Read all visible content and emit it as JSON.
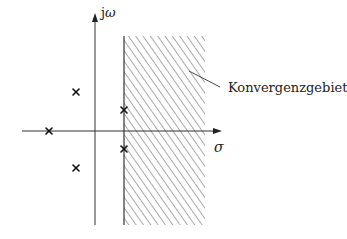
{
  "diagram": {
    "type": "pole-zero-plot",
    "axes": {
      "vertical_label_prefix": "j",
      "vertical_label_symbol": "ω",
      "horizontal_label": "σ"
    },
    "region": {
      "label": "Konvergenzgebiet",
      "hatch": "diagonal"
    },
    "poles": [
      {
        "marker": "×",
        "x": 76,
        "y": 92
      },
      {
        "marker": "×",
        "x": 49,
        "y": 131
      },
      {
        "marker": "×",
        "x": 76,
        "y": 168
      },
      {
        "marker": "×",
        "x": 124,
        "y": 110
      },
      {
        "marker": "×",
        "x": 124,
        "y": 149
      }
    ],
    "colors": {
      "axis": "#333333",
      "hatch": "#555555",
      "marker": "#111111",
      "background": "#ffffff"
    }
  }
}
